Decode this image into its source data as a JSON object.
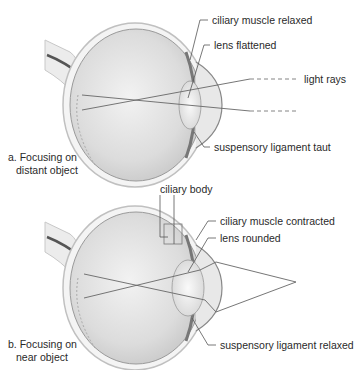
{
  "panels": [
    {
      "id": "a",
      "caption_line1": "a. Focusing on",
      "caption_line2": "distant object",
      "labels": {
        "ciliary_muscle": "ciliary muscle relaxed",
        "lens": "lens flattened",
        "light_rays": "light rays",
        "suspensory_ligament": "suspensory ligament taut"
      },
      "ray_type": "parallel"
    },
    {
      "id": "b",
      "caption_line1": "b. Focusing on",
      "caption_line2": "near object",
      "labels": {
        "ciliary_body": "ciliary body",
        "ciliary_muscle": "ciliary muscle contracted",
        "lens": "lens rounded",
        "suspensory_ligament": "suspensory ligament relaxed"
      },
      "ray_type": "diverging"
    }
  ],
  "colors": {
    "eyeball_fill": "#e4e4e4",
    "sclera_outline": "#bcbcbc",
    "leader_line": "#555555",
    "ray_line": "#666666",
    "nerve": "#555555"
  }
}
